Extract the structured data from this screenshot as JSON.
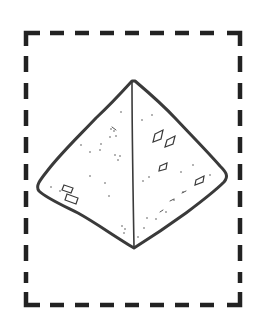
{
  "illustration": {
    "subject": "pyramid",
    "alt": "Hand-drawn pyramid inside a dashed frame",
    "colors": {
      "background": "#ffffff",
      "stroke": "#3a3a3a",
      "frame": "#222222"
    },
    "frame": {
      "x": 26,
      "y": 32,
      "width": 215,
      "height": 274,
      "style": "dashed"
    },
    "pyramid": {
      "apex": [
        132,
        80
      ],
      "left_corner": [
        38,
        190
      ],
      "right_corner": [
        226,
        175
      ],
      "bottom_corner": [
        134,
        249
      ]
    }
  }
}
